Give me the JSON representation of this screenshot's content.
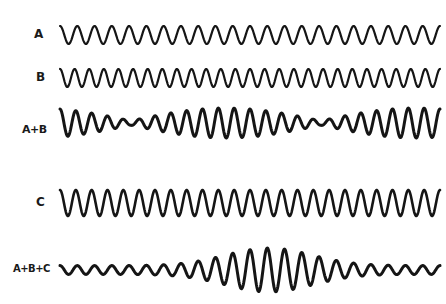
{
  "diagram": {
    "type": "wave-superposition",
    "rows": [
      {
        "id": "A",
        "label": "A",
        "y": 35,
        "kind": "sine",
        "cycles": 22,
        "amp": 9
      },
      {
        "id": "B",
        "label": "B",
        "y": 78,
        "kind": "sine",
        "cycles": 26,
        "amp": 9
      },
      {
        "id": "AB",
        "label": "A+B",
        "y": 123,
        "kind": "beat",
        "amp": 15
      },
      {
        "id": "C",
        "label": "C",
        "y": 203,
        "kind": "sine",
        "cycles": 24,
        "amp": 13
      },
      {
        "id": "ABC",
        "label": "A+B+C",
        "y": 270,
        "kind": "packet",
        "amp": 22
      }
    ]
  },
  "colors": {
    "ink": "#151515",
    "background": "#ffffff"
  }
}
